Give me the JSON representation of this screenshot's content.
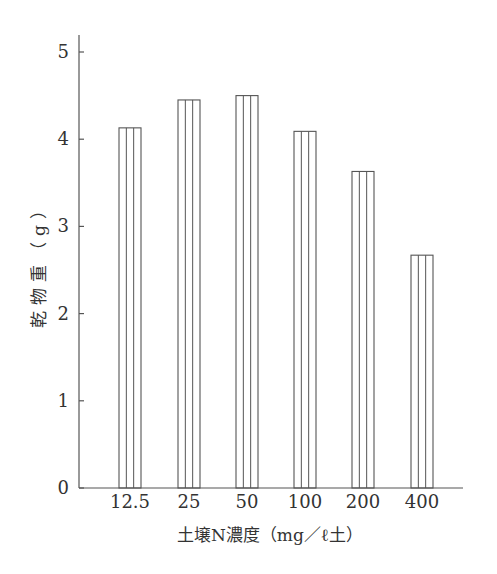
{
  "chart_data": {
    "type": "bar",
    "title": "",
    "xlabel": "土壌N濃度（mg／ℓ土）",
    "ylabel": "乾物重（g）",
    "categories": [
      "12.5",
      "25",
      "50",
      "100",
      "200",
      "400"
    ],
    "values": [
      4.13,
      4.45,
      4.5,
      4.09,
      3.63,
      2.67
    ],
    "ylim": [
      0,
      5
    ],
    "yticks": [
      "0",
      "1",
      "2",
      "3",
      "4",
      "5"
    ],
    "grid": false,
    "legend": null,
    "bar_style": "white fill with vertical stripes"
  },
  "colors": {
    "stroke": "#555555",
    "text": "#333333",
    "background": "#ffffff"
  }
}
